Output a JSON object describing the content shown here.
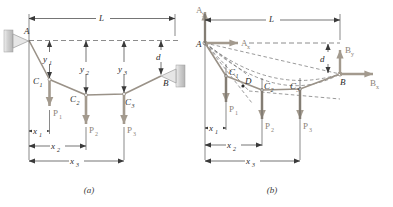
{
  "figure": {
    "panels": [
      {
        "id": "a",
        "caption": "(a)",
        "name": "cable-with-three-loads-free-body",
        "supports": [
          {
            "name": "pin-support-A",
            "point_label": "A"
          },
          {
            "name": "pin-support-B",
            "point_label": "B"
          }
        ],
        "points": [
          {
            "label": "A",
            "sub": ""
          },
          {
            "label": "B",
            "sub": ""
          },
          {
            "label": "C",
            "sub": "1"
          },
          {
            "label": "C",
            "sub": "2"
          },
          {
            "label": "C",
            "sub": "3"
          }
        ],
        "loads": [
          {
            "label": "P",
            "sub": "1",
            "direction": "down"
          },
          {
            "label": "P",
            "sub": "2",
            "direction": "down"
          },
          {
            "label": "P",
            "sub": "3",
            "direction": "down"
          }
        ],
        "dimensions": [
          {
            "label": "L",
            "sub": "",
            "orientation": "horizontal"
          },
          {
            "label": "y",
            "sub": "1",
            "orientation": "vertical"
          },
          {
            "label": "y",
            "sub": "2",
            "orientation": "vertical"
          },
          {
            "label": "y",
            "sub": "3",
            "orientation": "vertical"
          },
          {
            "label": "d",
            "sub": "",
            "orientation": "vertical"
          },
          {
            "label": "x",
            "sub": "1",
            "orientation": "horizontal"
          },
          {
            "label": "x",
            "sub": "2",
            "orientation": "horizontal"
          },
          {
            "label": "x",
            "sub": "3",
            "orientation": "horizontal"
          }
        ]
      },
      {
        "id": "b",
        "caption": "(b)",
        "name": "cable-free-body-with-reactions",
        "points": [
          {
            "label": "A",
            "sub": ""
          },
          {
            "label": "B",
            "sub": ""
          },
          {
            "label": "C",
            "sub": "1"
          },
          {
            "label": "C",
            "sub": "2"
          },
          {
            "label": "C",
            "sub": "3"
          },
          {
            "label": "D",
            "sub": ""
          }
        ],
        "reactions": [
          {
            "label": "A",
            "sub": "y",
            "direction": "up"
          },
          {
            "label": "A",
            "sub": "x",
            "direction": "right"
          },
          {
            "label": "B",
            "sub": "y",
            "direction": "up"
          },
          {
            "label": "B",
            "sub": "x",
            "direction": "right"
          }
        ],
        "loads": [
          {
            "label": "P",
            "sub": "1",
            "direction": "down"
          },
          {
            "label": "P",
            "sub": "2",
            "direction": "down"
          },
          {
            "label": "P",
            "sub": "3",
            "direction": "down"
          }
        ],
        "dimensions": [
          {
            "label": "L",
            "sub": "",
            "orientation": "horizontal"
          },
          {
            "label": "d",
            "sub": "",
            "orientation": "vertical"
          },
          {
            "label": "x",
            "sub": "1",
            "orientation": "horizontal"
          },
          {
            "label": "x",
            "sub": "2",
            "orientation": "horizontal"
          },
          {
            "label": "x",
            "sub": "3",
            "orientation": "horizontal"
          }
        ]
      }
    ],
    "colors": {
      "cable": "#9a9288",
      "force_arrow": "#a39a8e",
      "dimension_line": "#3a3a3a",
      "dashed_line": "#6f6f6f",
      "support_fill": "#c9c9c9",
      "label_text": "#2b2b2b",
      "force_text": "#8c8378",
      "background": "#ffffff"
    }
  }
}
